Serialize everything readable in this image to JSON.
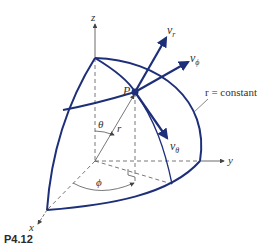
{
  "figure": {
    "caption": "P4.12",
    "axes": {
      "x": "x",
      "y": "y",
      "z": "z"
    },
    "point_label": "P",
    "radius_label": "r",
    "theta_label": "θ",
    "phi_label": "ϕ",
    "vectors": {
      "v_r": {
        "base": "v",
        "sub": "r"
      },
      "v_phi": {
        "base": "v",
        "sub": "ϕ"
      },
      "v_theta": {
        "base": "v",
        "sub": "θ"
      }
    },
    "surface_label": "r = constant",
    "colors": {
      "surface": "#1e2f7a",
      "axes": "#444444"
    }
  }
}
